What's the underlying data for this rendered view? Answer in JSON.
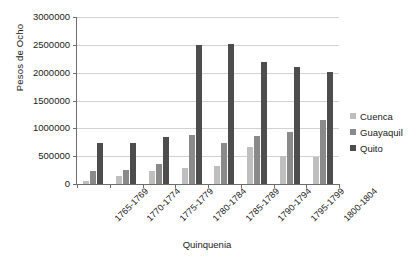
{
  "chart_data": {
    "type": "bar",
    "title": "",
    "xlabel": "Quinquenia",
    "ylabel": "Pesos de Ocho",
    "ylim": [
      0,
      3000000
    ],
    "ytick_step": 500000,
    "yticks": [
      "3000000",
      "2500000",
      "2000000",
      "1500000",
      "1000000",
      "500000",
      "0"
    ],
    "grid": true,
    "legend_position": "right",
    "categories": [
      "1765-1769",
      "1770-1774",
      "1775-1779",
      "1780-1784",
      "1785-1789",
      "1790-1794",
      "1795-1799",
      "1800-1804"
    ],
    "series": [
      {
        "name": "Cuenca",
        "color": "#bfbfbf",
        "values": [
          60000,
          150000,
          230000,
          290000,
          320000,
          660000,
          500000,
          490000
        ]
      },
      {
        "name": "Guayaquil",
        "color": "#8a8a8a",
        "values": [
          235000,
          245000,
          360000,
          875000,
          745000,
          860000,
          930000,
          1150000
        ]
      },
      {
        "name": "Quito",
        "color": "#4d4d4d",
        "values": [
          740000,
          740000,
          845000,
          2490000,
          2510000,
          2200000,
          2110000,
          2010000
        ]
      }
    ]
  }
}
